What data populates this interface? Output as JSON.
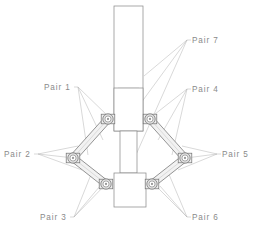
{
  "diagram": {
    "background_color": "#ffffff",
    "line_color": "#8c8c8c",
    "hidden_line_color": "#c9c9c9",
    "leader_color": "#b3b3b3",
    "label_color": "#8a8a8a",
    "joint_fill": "#e0e0e0",
    "link_fill": "#f2f2f2"
  },
  "labels": [
    {
      "id": "pair-1",
      "text": "Pair  1",
      "x": 44,
      "y": 90,
      "anchor": "start",
      "targets": [
        [
          110,
          118
        ],
        [
          103,
          140
        ],
        [
          88,
          155
        ]
      ]
    },
    {
      "id": "pair-2",
      "text": "Pair  2",
      "x": 4,
      "y": 157,
      "anchor": "start",
      "targets": [
        [
          78,
          146
        ],
        [
          74,
          158
        ],
        [
          82,
          170
        ]
      ]
    },
    {
      "id": "pair-3",
      "text": "Pair  3",
      "x": 40,
      "y": 220,
      "anchor": "start",
      "targets": [
        [
          100,
          186
        ],
        [
          108,
          182
        ],
        [
          92,
          172
        ]
      ]
    },
    {
      "id": "pair-4",
      "text": "Pair  4",
      "x": 192,
      "y": 92,
      "anchor": "start",
      "targets": [
        [
          150,
          118
        ],
        [
          158,
          140
        ],
        [
          172,
          155
        ]
      ]
    },
    {
      "id": "pair-5",
      "text": "Pair  5",
      "x": 222,
      "y": 157,
      "anchor": "start",
      "targets": [
        [
          182,
          146
        ],
        [
          186,
          158
        ],
        [
          178,
          170
        ]
      ]
    },
    {
      "id": "pair-6",
      "text": "Pair  6",
      "x": 192,
      "y": 220,
      "anchor": "start",
      "targets": [
        [
          160,
          186
        ],
        [
          152,
          182
        ],
        [
          168,
          172
        ]
      ]
    },
    {
      "id": "pair-7",
      "text": "Pair  7",
      "x": 192,
      "y": 43,
      "anchor": "start",
      "targets": [
        [
          144,
          76
        ],
        [
          130,
          118
        ],
        [
          127,
          175
        ]
      ]
    }
  ],
  "geometry": {
    "column": {
      "x": 114,
      "y": 6,
      "width": 29,
      "height": 125,
      "label": "vertical-column"
    },
    "column_inner": {
      "x": 118,
      "y": 88,
      "width": 21,
      "height": 43
    },
    "upper_block": {
      "x": 114,
      "y": 88,
      "width": 29,
      "height": 43
    },
    "shaft": {
      "x": 120,
      "y": 131,
      "width": 17,
      "height": 42
    },
    "lower_block": {
      "x": 114,
      "y": 173,
      "width": 32,
      "height": 34
    },
    "joints": [
      {
        "id": "joint-upper-left",
        "cx": 108,
        "cy": 119,
        "r": 5.2
      },
      {
        "id": "joint-upper-right",
        "cx": 150,
        "cy": 119,
        "r": 5.2
      },
      {
        "id": "joint-left-apex",
        "cx": 73,
        "cy": 158,
        "r": 5.2
      },
      {
        "id": "joint-right-apex",
        "cx": 185,
        "cy": 158,
        "r": 5.2
      },
      {
        "id": "joint-lower-left",
        "cx": 106,
        "cy": 184,
        "r": 5.2
      },
      {
        "id": "joint-lower-right",
        "cx": 152,
        "cy": 184,
        "r": 5.2
      }
    ],
    "links": [
      {
        "id": "link-upper-left",
        "x1": 108,
        "y1": 119,
        "x2": 73,
        "y2": 158
      },
      {
        "id": "link-lower-left",
        "x1": 73,
        "y1": 158,
        "x2": 106,
        "y2": 184
      },
      {
        "id": "link-upper-right",
        "x1": 150,
        "y1": 119,
        "x2": 185,
        "y2": 158
      },
      {
        "id": "link-lower-right",
        "x1": 185,
        "y1": 158,
        "x2": 152,
        "y2": 184
      }
    ]
  }
}
